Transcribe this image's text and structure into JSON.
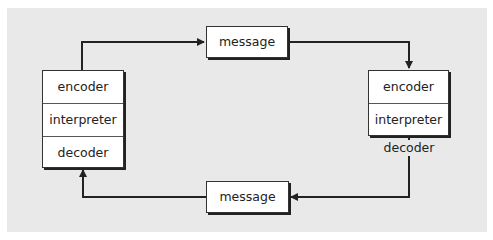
{
  "diagram": {
    "left_node": {
      "cells": [
        "encoder",
        "interpreter",
        "decoder"
      ]
    },
    "right_node": {
      "cells": [
        "encoder",
        "interpreter"
      ],
      "outside_label": "decoder"
    },
    "top_message": "message",
    "bottom_message": "message",
    "colors": {
      "panel": "#e9e9e9",
      "box": "#ffffff",
      "line": "#222222"
    }
  }
}
